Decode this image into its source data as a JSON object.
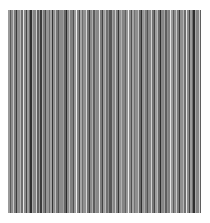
{
  "image": {
    "description": "vertical grayscale stripe texture",
    "background": "#ffffff",
    "field": {
      "x": 8,
      "y": 10,
      "width": 193,
      "height": 203
    },
    "stripes": [
      {
        "w": 2,
        "c": "#9a9a9a"
      },
      {
        "w": 1,
        "c": "#5a5a5a"
      },
      {
        "w": 2,
        "c": "#8c8c8c"
      },
      {
        "w": 1,
        "c": "#c8c8c8"
      },
      {
        "w": 2,
        "c": "#7a7a7a"
      },
      {
        "w": 1,
        "c": "#3a3a3a"
      },
      {
        "w": 3,
        "c": "#8f8f8f"
      },
      {
        "w": 1,
        "c": "#b5b5b5"
      },
      {
        "w": 2,
        "c": "#6e6e6e"
      },
      {
        "w": 1,
        "c": "#e6e6e6"
      },
      {
        "w": 2,
        "c": "#8a8a8a"
      },
      {
        "w": 1,
        "c": "#444444"
      },
      {
        "w": 2,
        "c": "#9c9c9c"
      },
      {
        "w": 1,
        "c": "#707070"
      },
      {
        "w": 2,
        "c": "#2e2e2e"
      },
      {
        "w": 1,
        "c": "#a8a8a8"
      },
      {
        "w": 3,
        "c": "#858585"
      },
      {
        "w": 1,
        "c": "#d0d0d0"
      },
      {
        "w": 2,
        "c": "#5f5f5f"
      },
      {
        "w": 1,
        "c": "#939393"
      },
      {
        "w": 2,
        "c": "#3c3c3c"
      },
      {
        "w": 1,
        "c": "#b0b0b0"
      },
      {
        "w": 2,
        "c": "#7c7c7c"
      },
      {
        "w": 1,
        "c": "#4a4a4a"
      },
      {
        "w": 3,
        "c": "#959595"
      },
      {
        "w": 1,
        "c": "#6a6a6a"
      },
      {
        "w": 2,
        "c": "#a2a2a2"
      },
      {
        "w": 1,
        "c": "#333333"
      },
      {
        "w": 2,
        "c": "#8e8e8e"
      },
      {
        "w": 1,
        "c": "#c0c0c0"
      },
      {
        "w": 2,
        "c": "#777777"
      },
      {
        "w": 1,
        "c": "#545454"
      },
      {
        "w": 4,
        "c": "#8b8b8b"
      },
      {
        "w": 1,
        "c": "#9f9f9f"
      },
      {
        "w": 2,
        "c": "#666666"
      },
      {
        "w": 1,
        "c": "#2b2b2b"
      },
      {
        "w": 2,
        "c": "#8d8d8d"
      },
      {
        "w": 1,
        "c": "#bdbdbd"
      },
      {
        "w": 3,
        "c": "#7f7f7f"
      },
      {
        "w": 1,
        "c": "#505050"
      },
      {
        "w": 2,
        "c": "#999999"
      },
      {
        "w": 1,
        "c": "#f0f0f0"
      },
      {
        "w": 2,
        "c": "#838383"
      },
      {
        "w": 1,
        "c": "#484848"
      },
      {
        "w": 2,
        "c": "#a5a5a5"
      },
      {
        "w": 1,
        "c": "#6c6c6c"
      },
      {
        "w": 3,
        "c": "#909090"
      },
      {
        "w": 1,
        "c": "#d8d8d8"
      },
      {
        "w": 2,
        "c": "#747474"
      },
      {
        "w": 1,
        "c": "#3f3f3f"
      },
      {
        "w": 2,
        "c": "#8a8a8a"
      },
      {
        "w": 1,
        "c": "#acacac"
      },
      {
        "w": 2,
        "c": "#5c5c5c"
      },
      {
        "w": 1,
        "c": "#969696"
      },
      {
        "w": 3,
        "c": "#888888"
      },
      {
        "w": 1,
        "c": "#e0e0e0"
      },
      {
        "w": 2,
        "c": "#7b7b7b"
      },
      {
        "w": 1,
        "c": "#424242"
      },
      {
        "w": 2,
        "c": "#9b9b9b"
      },
      {
        "w": 1,
        "c": "#b8b8b8"
      },
      {
        "w": 2,
        "c": "#6f6f6f"
      },
      {
        "w": 1,
        "c": "#8c8c8c"
      },
      {
        "w": 3,
        "c": "#565656"
      },
      {
        "w": 1,
        "c": "#a0a0a0"
      },
      {
        "w": 2,
        "c": "#868686"
      },
      {
        "w": 1,
        "c": "#cacaca"
      },
      {
        "w": 2,
        "c": "#7d7d7d"
      },
      {
        "w": 1,
        "c": "#363636"
      },
      {
        "w": 2,
        "c": "#929292"
      },
      {
        "w": 1,
        "c": "#b2b2b2"
      },
      {
        "w": 3,
        "c": "#848484"
      },
      {
        "w": 1,
        "c": "#606060"
      },
      {
        "w": 2,
        "c": "#979797"
      },
      {
        "w": 1,
        "c": "#ececec"
      },
      {
        "w": 2,
        "c": "#898989"
      },
      {
        "w": 1,
        "c": "#4e4e4e"
      },
      {
        "w": 2,
        "c": "#a3a3a3"
      },
      {
        "w": 1,
        "c": "#727272"
      },
      {
        "w": 3,
        "c": "#8f8f8f"
      },
      {
        "w": 1,
        "c": "#c4c4c4"
      },
      {
        "w": 2,
        "c": "#686868"
      },
      {
        "w": 1,
        "c": "#303030"
      },
      {
        "w": 2,
        "c": "#949494"
      },
      {
        "w": 1,
        "c": "#aaaaaa"
      },
      {
        "w": 2,
        "c": "#7e7e7e"
      },
      {
        "w": 1,
        "c": "#525252"
      },
      {
        "w": 3,
        "c": "#8b8b8b"
      },
      {
        "w": 1,
        "c": "#d4d4d4"
      },
      {
        "w": 2,
        "c": "#767676"
      },
      {
        "w": 1,
        "c": "#464646"
      },
      {
        "w": 2,
        "c": "#9e9e9e"
      },
      {
        "w": 1,
        "c": "#bababa"
      },
      {
        "w": 2,
        "c": "#6b6b6b"
      },
      {
        "w": 1,
        "c": "#2c2c2c"
      },
      {
        "w": 3,
        "c": "#878787"
      },
      {
        "w": 1,
        "c": "#a6a6a6"
      },
      {
        "w": 2,
        "c": "#5e5e5e"
      },
      {
        "w": 1,
        "c": "#919191"
      },
      {
        "w": 2,
        "c": "#808080"
      },
      {
        "w": 1,
        "c": "#e4e4e4"
      }
    ]
  }
}
